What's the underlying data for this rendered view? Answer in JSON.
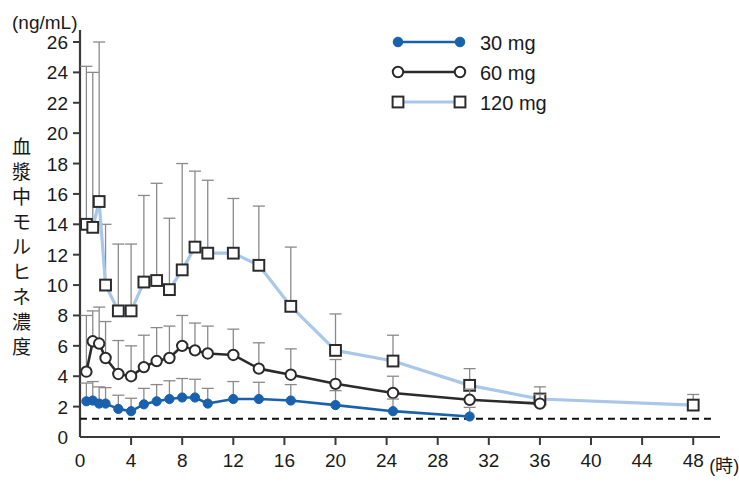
{
  "chart_data": {
    "type": "line",
    "title": "",
    "unit_label": "(ng/mL)",
    "ylabel": "血漿中モルヒネ濃度",
    "xlabel": "(時)",
    "ylim": [
      0,
      26
    ],
    "xlim": [
      0,
      49
    ],
    "y_ticks": [
      0,
      2,
      4,
      6,
      8,
      10,
      12,
      14,
      16,
      18,
      20,
      22,
      24,
      26
    ],
    "x_ticks": [
      0,
      4,
      8,
      12,
      16,
      20,
      24,
      28,
      32,
      36,
      40,
      44,
      48
    ],
    "grid": false,
    "legend_position": "top-center",
    "error_bars": "upper-only",
    "threshold_line": {
      "value": 1.2,
      "style": "dashed"
    },
    "series": [
      {
        "name": "30 mg",
        "color": "#1961ac",
        "marker": "filled-circle",
        "x": [
          0.5,
          1.0,
          1.5,
          2.0,
          3.0,
          4.0,
          5.0,
          6.0,
          7.0,
          8.0,
          9.0,
          10.0,
          12.0,
          14.0,
          16.5,
          20.0,
          24.5,
          30.5
        ],
        "y": [
          2.35,
          2.4,
          2.2,
          2.2,
          1.85,
          1.7,
          2.15,
          2.35,
          2.5,
          2.6,
          2.6,
          2.2,
          2.5,
          2.5,
          2.4,
          2.1,
          1.7,
          1.35
        ],
        "yerr": [
          1.2,
          1.25,
          1.1,
          1.05,
          0.9,
          0.85,
          1.05,
          1.1,
          1.2,
          1.25,
          1.2,
          1.0,
          1.15,
          1.1,
          1.05,
          0.95,
          0.8,
          0.6
        ]
      },
      {
        "name": "60 mg",
        "color": "#2b2b2b",
        "marker": "open-circle",
        "x": [
          0.5,
          1.0,
          1.5,
          2.0,
          3.0,
          4.0,
          5.0,
          6.0,
          7.0,
          8.0,
          9.0,
          10.0,
          12.0,
          14.0,
          16.5,
          20.0,
          24.5,
          30.5,
          36.0
        ],
        "y": [
          4.3,
          6.3,
          6.15,
          5.2,
          4.15,
          4.0,
          4.6,
          5.0,
          5.2,
          6.0,
          5.7,
          5.5,
          5.4,
          4.5,
          4.1,
          3.5,
          2.9,
          2.45,
          2.2
        ],
        "yerr": [
          3.7,
          2.0,
          2.4,
          2.4,
          2.2,
          2.0,
          2.1,
          2.2,
          2.1,
          2.0,
          1.8,
          1.8,
          1.7,
          1.7,
          1.7,
          1.6,
          1.1,
          0.7,
          0.6
        ]
      },
      {
        "name": "120 mg",
        "color": "#a9c7e8",
        "marker": "open-square",
        "x": [
          0.5,
          1.0,
          1.5,
          2.0,
          3.0,
          4.0,
          5.0,
          6.0,
          7.0,
          8.0,
          9.0,
          10.0,
          12.0,
          14.0,
          16.5,
          20.0,
          24.5,
          30.5,
          36.0,
          48.0
        ],
        "y": [
          14.0,
          13.8,
          15.5,
          10.0,
          8.3,
          8.3,
          10.2,
          10.3,
          9.7,
          11.0,
          12.5,
          12.1,
          12.1,
          11.3,
          8.6,
          5.7,
          5.0,
          3.4,
          2.5,
          2.1
        ],
        "yerr": [
          10.4,
          10.2,
          10.5,
          4.0,
          4.4,
          4.4,
          5.7,
          6.4,
          4.7,
          7.0,
          5.0,
          4.8,
          3.6,
          3.9,
          3.9,
          2.4,
          1.7,
          1.1,
          0.8,
          0.7
        ]
      }
    ]
  },
  "legend": {
    "items": [
      {
        "label": "30 mg"
      },
      {
        "label": "60 mg"
      },
      {
        "label": "120 mg"
      }
    ]
  },
  "axes": {
    "unit_label": "(ng/mL)",
    "y_title": "血漿中モルヒネ濃度",
    "x_unit": "(時)"
  }
}
